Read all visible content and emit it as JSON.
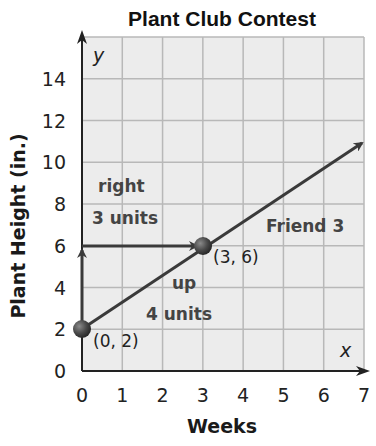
{
  "chart_data": {
    "type": "line",
    "title": "Plant Club Contest",
    "xlabel": "Weeks",
    "ylabel": "Plant Height (in.)",
    "x_axis_var": "x",
    "y_axis_var": "y",
    "xlim": [
      0,
      7
    ],
    "ylim": [
      0,
      16
    ],
    "x_ticks": [
      0,
      1,
      2,
      3,
      4,
      5,
      6,
      7
    ],
    "y_ticks": [
      0,
      2,
      4,
      6,
      8,
      10,
      12,
      14
    ],
    "grid": true,
    "series": [
      {
        "name": "Friend 3",
        "x": [
          0,
          3,
          7
        ],
        "y": [
          2,
          6,
          11.33
        ],
        "equation": "y = (4/3)x + 2",
        "arrow_end": true
      }
    ],
    "points": [
      {
        "x": 0,
        "y": 2,
        "label": "(0, 2)"
      },
      {
        "x": 3,
        "y": 6,
        "label": "(3, 6)"
      }
    ],
    "annotations": [
      {
        "text_line1": "up",
        "text_line2": "4 units",
        "arrow_from": [
          0,
          2
        ],
        "arrow_to": [
          0,
          6
        ]
      },
      {
        "text_line1": "right",
        "text_line2": "3 units",
        "arrow_from": [
          0,
          6
        ],
        "arrow_to": [
          3,
          6
        ]
      },
      {
        "text": "Friend 3"
      }
    ],
    "colors": {
      "line": "#3a3a3a",
      "grid": "#b8b8b8",
      "plot_bg": "#ececec",
      "point": "#4a4a4a"
    }
  }
}
